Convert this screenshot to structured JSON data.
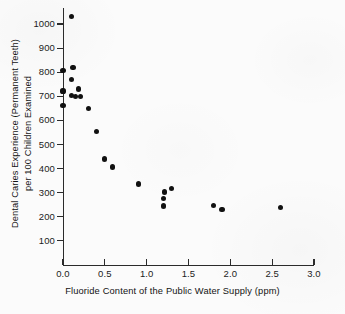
{
  "chart_data": {
    "type": "scatter",
    "title": "",
    "xlabel": "Fluoride Content of the Public Water Supply (ppm)",
    "ylabel": "Dental Caries Experience (Permanent Teeth) per 100 Children Examined",
    "ylabel_line1": "Dental Caries Experience (Permanent Teeth)",
    "ylabel_line2": "per 100 Children Examined",
    "xlim": [
      0.0,
      3.0
    ],
    "ylim": [
      0,
      1080
    ],
    "grid": false,
    "legend": null,
    "xticks": [
      0.0,
      0.5,
      1.0,
      1.5,
      2.0,
      2.5,
      3.0
    ],
    "xtick_labels": [
      "0.0",
      "0.5",
      "1.0",
      "1.5",
      "2.0",
      "2.5",
      "3.0"
    ],
    "yticks": [
      100,
      200,
      300,
      400,
      500,
      600,
      700,
      800,
      900,
      1000
    ],
    "ytick_labels": [
      "100",
      "200",
      "300",
      "400",
      "500",
      "600",
      "700",
      "800",
      "900",
      "1000"
    ],
    "marker": "filled-circle",
    "marker_color": "#111111",
    "points": [
      {
        "x": 0.1,
        "y": 1030
      },
      {
        "x": 0.0,
        "y": 808
      },
      {
        "x": 0.12,
        "y": 820
      },
      {
        "x": 0.1,
        "y": 770
      },
      {
        "x": 0.0,
        "y": 722
      },
      {
        "x": 0.1,
        "y": 703
      },
      {
        "x": 0.19,
        "y": 730
      },
      {
        "x": 0.15,
        "y": 700
      },
      {
        "x": 0.21,
        "y": 700
      },
      {
        "x": 0.0,
        "y": 663
      },
      {
        "x": 0.3,
        "y": 648
      },
      {
        "x": 0.4,
        "y": 555
      },
      {
        "x": 0.5,
        "y": 440
      },
      {
        "x": 0.59,
        "y": 407
      },
      {
        "x": 0.9,
        "y": 336
      },
      {
        "x": 1.21,
        "y": 303
      },
      {
        "x": 1.2,
        "y": 275
      },
      {
        "x": 1.2,
        "y": 245
      },
      {
        "x": 1.3,
        "y": 316
      },
      {
        "x": 1.8,
        "y": 246
      },
      {
        "x": 1.9,
        "y": 231
      },
      {
        "x": 2.6,
        "y": 238
      }
    ]
  },
  "axes": {
    "x_axis_name": "fluoride-axis",
    "y_axis_name": "caries-axis"
  }
}
